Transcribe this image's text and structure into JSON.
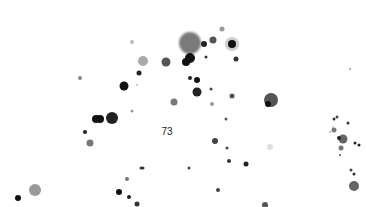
{
  "image": {
    "width": 366,
    "height": 207,
    "background": "#ffffff",
    "label": {
      "text": "73",
      "x": 167,
      "y": 131
    },
    "dots": [
      {
        "x": 190,
        "y": 43,
        "r": 11,
        "color": "#7a7a7a",
        "blur": 1
      },
      {
        "x": 190,
        "y": 58,
        "r": 5,
        "color": "#111111",
        "blur": 0.5
      },
      {
        "x": 186,
        "y": 62,
        "r": 4,
        "color": "#111111",
        "blur": 0.5
      },
      {
        "x": 204,
        "y": 44,
        "r": 3,
        "color": "#222222",
        "blur": 0.5
      },
      {
        "x": 213,
        "y": 40,
        "r": 3.5,
        "color": "#555555",
        "blur": 0.5
      },
      {
        "x": 222,
        "y": 29,
        "r": 2.5,
        "color": "#999999",
        "blur": 0.5
      },
      {
        "x": 232,
        "y": 44,
        "r": 7,
        "color": "#cfcfcf",
        "blur": 0.5
      },
      {
        "x": 232,
        "y": 44,
        "r": 4,
        "color": "#111111",
        "blur": 0.5
      },
      {
        "x": 236,
        "y": 59,
        "r": 2.5,
        "color": "#333333",
        "blur": 0.5
      },
      {
        "x": 206,
        "y": 57,
        "r": 1.5,
        "color": "#333333",
        "blur": 0.3
      },
      {
        "x": 166,
        "y": 62,
        "r": 4.5,
        "color": "#555555",
        "blur": 0.5
      },
      {
        "x": 143,
        "y": 61,
        "r": 5,
        "color": "#aaaaaa",
        "blur": 0.5
      },
      {
        "x": 132,
        "y": 42,
        "r": 2,
        "color": "#bbbbbb",
        "blur": 0.5
      },
      {
        "x": 139,
        "y": 73,
        "r": 2.5,
        "color": "#222222",
        "blur": 0.5
      },
      {
        "x": 124,
        "y": 86,
        "r": 4.5,
        "color": "#111111",
        "blur": 0.5
      },
      {
        "x": 80,
        "y": 78,
        "r": 2,
        "color": "#888888",
        "blur": 0.5
      },
      {
        "x": 137,
        "y": 85,
        "r": 1,
        "color": "#bbbbbb",
        "blur": 0.3
      },
      {
        "x": 174,
        "y": 102,
        "r": 3.5,
        "color": "#777777",
        "blur": 0.5
      },
      {
        "x": 190,
        "y": 78,
        "r": 2,
        "color": "#222222",
        "blur": 0.3
      },
      {
        "x": 197,
        "y": 80,
        "r": 3,
        "color": "#111111",
        "blur": 0.3
      },
      {
        "x": 197,
        "y": 92,
        "r": 4.5,
        "color": "#222222",
        "blur": 0.5
      },
      {
        "x": 211,
        "y": 89,
        "r": 1.5,
        "color": "#444444",
        "blur": 0.3
      },
      {
        "x": 212,
        "y": 104,
        "r": 2,
        "color": "#999999",
        "blur": 0.3
      },
      {
        "x": 232,
        "y": 96,
        "r": 2.5,
        "color": "#555555",
        "blur": 0.5
      },
      {
        "x": 271,
        "y": 100,
        "r": 7,
        "color": "#555555",
        "blur": 0.5
      },
      {
        "x": 268,
        "y": 104,
        "r": 3,
        "color": "#111111",
        "blur": 0.3
      },
      {
        "x": 350,
        "y": 69,
        "r": 1,
        "color": "#999999",
        "blur": 0.3
      },
      {
        "x": 96,
        "y": 119,
        "r": 4,
        "color": "#111111",
        "blur": 0.3
      },
      {
        "x": 100,
        "y": 119,
        "r": 4,
        "color": "#111111",
        "blur": 0.3
      },
      {
        "x": 112,
        "y": 118,
        "r": 6,
        "color": "#222222",
        "blur": 0.5
      },
      {
        "x": 132,
        "y": 111,
        "r": 1.5,
        "color": "#999999",
        "blur": 0.3
      },
      {
        "x": 85,
        "y": 132,
        "r": 2,
        "color": "#222222",
        "blur": 0.3
      },
      {
        "x": 90,
        "y": 143,
        "r": 3.5,
        "color": "#777777",
        "blur": 0.5
      },
      {
        "x": 215,
        "y": 141,
        "r": 3,
        "color": "#444444",
        "blur": 0.3
      },
      {
        "x": 226,
        "y": 119,
        "r": 1.5,
        "color": "#555555",
        "blur": 0.3
      },
      {
        "x": 227,
        "y": 148,
        "r": 1.5,
        "color": "#444444",
        "blur": 0.3
      },
      {
        "x": 229,
        "y": 161,
        "r": 2,
        "color": "#333333",
        "blur": 0.3
      },
      {
        "x": 270,
        "y": 147,
        "r": 3,
        "color": "#dddddd",
        "blur": 0.5
      },
      {
        "x": 189,
        "y": 168,
        "r": 1.5,
        "color": "#444444",
        "blur": 0.3
      },
      {
        "x": 218,
        "y": 190,
        "r": 2,
        "color": "#444444",
        "blur": 0.3
      },
      {
        "x": 246,
        "y": 164,
        "r": 2.5,
        "color": "#222222",
        "blur": 0.3
      },
      {
        "x": 141,
        "y": 168,
        "r": 1.5,
        "color": "#333333",
        "blur": 0.3
      },
      {
        "x": 143,
        "y": 168,
        "r": 1.5,
        "color": "#333333",
        "blur": 0.3
      },
      {
        "x": 127,
        "y": 179,
        "r": 2,
        "color": "#777777",
        "blur": 0.3
      },
      {
        "x": 119,
        "y": 192,
        "r": 3,
        "color": "#111111",
        "blur": 0.3
      },
      {
        "x": 129,
        "y": 197,
        "r": 2,
        "color": "#222222",
        "blur": 0.3
      },
      {
        "x": 137,
        "y": 204,
        "r": 2.5,
        "color": "#333333",
        "blur": 0.3
      },
      {
        "x": 265,
        "y": 205,
        "r": 3,
        "color": "#555555",
        "blur": 0.3
      },
      {
        "x": 35,
        "y": 190,
        "r": 6,
        "color": "#999999",
        "blur": 0.5
      },
      {
        "x": 18,
        "y": 198,
        "r": 3,
        "color": "#111111",
        "blur": 0.3
      },
      {
        "x": 334,
        "y": 119,
        "r": 1.5,
        "color": "#333333",
        "blur": 0.3
      },
      {
        "x": 337,
        "y": 117,
        "r": 1.5,
        "color": "#444444",
        "blur": 0.3
      },
      {
        "x": 334,
        "y": 130,
        "r": 2.5,
        "color": "#777777",
        "blur": 0.3
      },
      {
        "x": 343,
        "y": 139,
        "r": 4.5,
        "color": "#666666",
        "blur": 0.5
      },
      {
        "x": 339,
        "y": 138,
        "r": 2,
        "color": "#222222",
        "blur": 0.3
      },
      {
        "x": 341,
        "y": 148,
        "r": 2.5,
        "color": "#777777",
        "blur": 0.3
      },
      {
        "x": 348,
        "y": 123,
        "r": 1.5,
        "color": "#333333",
        "blur": 0.3
      },
      {
        "x": 355,
        "y": 143,
        "r": 1.5,
        "color": "#222222",
        "blur": 0.3
      },
      {
        "x": 359,
        "y": 145,
        "r": 1.5,
        "color": "#222222",
        "blur": 0.3
      },
      {
        "x": 340,
        "y": 155,
        "r": 1,
        "color": "#555555",
        "blur": 0.3
      },
      {
        "x": 351,
        "y": 170,
        "r": 1.5,
        "color": "#444444",
        "blur": 0.3
      },
      {
        "x": 354,
        "y": 174,
        "r": 1.5,
        "color": "#333333",
        "blur": 0.3
      },
      {
        "x": 354,
        "y": 186,
        "r": 5,
        "color": "#666666",
        "blur": 0.5
      },
      {
        "x": 330,
        "y": 132,
        "r": 1,
        "color": "#aaaaaa",
        "blur": 0.3
      },
      {
        "x": 333,
        "y": 127,
        "r": 1,
        "color": "#bbbbbb",
        "blur": 0.3
      }
    ]
  }
}
